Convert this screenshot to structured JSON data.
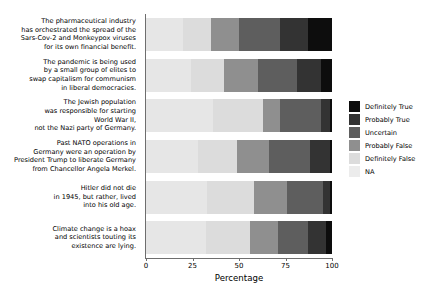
{
  "chart_data": {
    "type": "bar",
    "orientation": "horizontal",
    "stacked": true,
    "stack_mode": "percent",
    "title": "",
    "xlabel": "Percentage",
    "ylabel": "",
    "xlim": [
      0,
      100
    ],
    "xticks": [
      0,
      25,
      50,
      75,
      100
    ],
    "xticklabels": [
      "0",
      "25",
      "50",
      "75",
      "100"
    ],
    "grid": false,
    "legend_position": "right",
    "categories": [
      "The pharmaceutical industry\nhas orchestrated the spread of the\nSars-Cov-2 and Monkeypox viruses\nfor its own financial benefit.",
      "The pandemic is being used\nby a small group of elites to\nswap capitalism for communism\nin liberal democracies.",
      "The Jewish population\nwas responsible for starting\nWorld War II,\nnot the Nazi party of Germany.",
      "Past NATO operations in\nGermany were an operation by\nPresident Trump to liberate Germany\nfrom Chancellor Angela Merkel.",
      "Hitler did not die\nin 1945, but rather, lived\ninto his old age.",
      "Climate change is a hoax\nand scientists touting its\nexistence are lying."
    ],
    "series": [
      {
        "name": "NA",
        "color": "#e6e6e6",
        "values": [
          20,
          24,
          36,
          28,
          33,
          32
        ]
      },
      {
        "name": "Definitely False",
        "color": "#dcdcdc",
        "values": [
          15,
          18,
          27,
          21,
          25,
          24
        ]
      },
      {
        "name": "Probably False",
        "color": "#8f8f8f",
        "values": [
          15,
          18,
          9,
          17,
          18,
          15
        ]
      },
      {
        "name": "Uncertain",
        "color": "#5e5e5e",
        "values": [
          22,
          21,
          22,
          22,
          19,
          16
        ]
      },
      {
        "name": "Probably True",
        "color": "#333333",
        "values": [
          15,
          13,
          5,
          11,
          4,
          10
        ]
      },
      {
        "name": "Definitely True",
        "color": "#0d0d0d",
        "values": [
          13,
          6,
          1,
          1,
          1,
          3
        ]
      }
    ],
    "legend_entries": [
      {
        "label": "Definitely True",
        "color": "#0d0d0d"
      },
      {
        "label": "Probably True",
        "color": "#333333"
      },
      {
        "label": "Uncertain",
        "color": "#5e5e5e"
      },
      {
        "label": "Probably False",
        "color": "#8f8f8f"
      },
      {
        "label": "Definitely False",
        "color": "#dcdcdc"
      },
      {
        "label": "NA",
        "color": "#ececec"
      }
    ]
  }
}
